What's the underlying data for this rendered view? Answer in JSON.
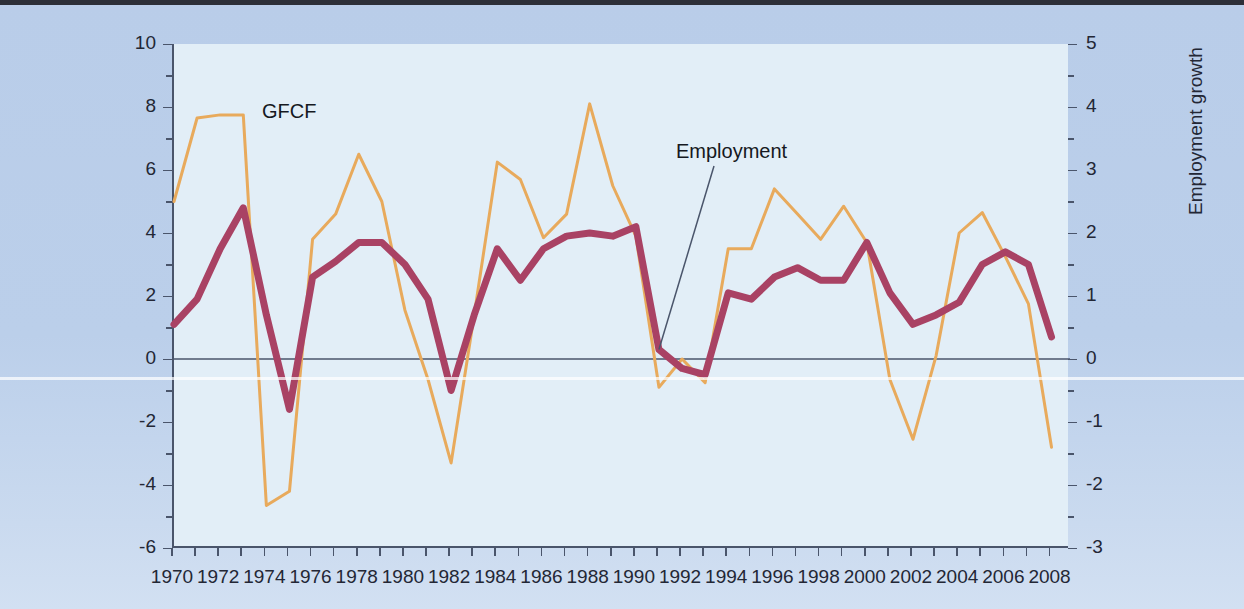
{
  "chart_data": {
    "type": "line",
    "title": "",
    "xlabel": "",
    "x": [
      1970,
      1971,
      1972,
      1973,
      1974,
      1975,
      1976,
      1977,
      1978,
      1979,
      1980,
      1981,
      1982,
      1983,
      1984,
      1985,
      1986,
      1987,
      1988,
      1989,
      1990,
      1991,
      1992,
      1993,
      1994,
      1995,
      1996,
      1997,
      1998,
      1999,
      2000,
      2001,
      2002,
      2003,
      2004,
      2005,
      2006,
      2007,
      2008
    ],
    "xtick_labels": [
      "1970",
      "1972",
      "1974",
      "1976",
      "1978",
      "1980",
      "1982",
      "1984",
      "1986",
      "1988",
      "1990",
      "1992",
      "1994",
      "1996",
      "1998",
      "2000",
      "2002",
      "2004",
      "2006",
      "2008"
    ],
    "xtick_values": [
      1970,
      1972,
      1974,
      1976,
      1978,
      1980,
      1982,
      1984,
      1986,
      1988,
      1990,
      1992,
      1994,
      1996,
      1998,
      2000,
      2002,
      2004,
      2006,
      2008
    ],
    "xlim": [
      1970,
      2008.8
    ],
    "grid": false,
    "legend_position": "inline-annotation",
    "axes": [
      {
        "id": "left",
        "label": "GFCF growth",
        "lim": [
          -6,
          10
        ],
        "ticks": [
          -6,
          -4,
          -2,
          0,
          2,
          4,
          6,
          8,
          10
        ],
        "tick_labels": [
          "-6",
          "-4",
          "-2",
          "0",
          "2",
          "4",
          "6",
          "8",
          "10"
        ],
        "minor_step": 1
      },
      {
        "id": "right",
        "label": "Employment growth",
        "lim": [
          -3,
          5
        ],
        "ticks": [
          -3,
          -2,
          -1,
          0,
          1,
          2,
          3,
          4,
          5
        ],
        "tick_labels": [
          "-3",
          "-2",
          "-1",
          "0",
          "1",
          "2",
          "3",
          "4",
          "5"
        ],
        "minor_step": 0.5
      }
    ],
    "series": [
      {
        "name": "GFCF",
        "axis": "left",
        "color": "#e8aa5c",
        "line_width": 3,
        "annotation": "GFCF",
        "values": [
          5.0,
          7.65,
          7.75,
          7.75,
          -4.65,
          -4.2,
          3.8,
          4.6,
          6.5,
          5.0,
          1.55,
          -0.65,
          -3.3,
          1.4,
          6.25,
          5.7,
          3.85,
          4.6,
          8.1,
          5.5,
          3.9,
          -0.9,
          0.0,
          -0.75,
          3.5,
          3.5,
          5.4,
          4.6,
          3.8,
          4.85,
          3.7,
          -0.65,
          -2.55,
          0.1,
          4.0,
          4.65,
          3.25,
          1.75,
          -2.8
        ]
      },
      {
        "name": "Employment",
        "axis": "right",
        "color": "#a94264",
        "line_width": 7,
        "annotation": "Employment",
        "values": [
          0.55,
          0.95,
          1.75,
          2.4,
          0.7,
          -0.8,
          1.3,
          1.55,
          1.85,
          1.85,
          1.5,
          0.95,
          -0.5,
          0.7,
          1.75,
          1.25,
          1.75,
          1.95,
          2.0,
          1.95,
          2.1,
          0.15,
          -0.15,
          -0.25,
          1.05,
          0.95,
          1.3,
          1.45,
          1.25,
          1.25,
          1.85,
          1.05,
          0.55,
          0.7,
          0.9,
          1.5,
          1.7,
          1.5,
          0.35
        ]
      }
    ],
    "annotations": [
      {
        "text": "GFCF",
        "x_fig": 262,
        "y_fig": 100
      },
      {
        "text": "Employment",
        "x_fig": 676,
        "y_fig": 140,
        "leader_to": {
          "year": 1991,
          "axis": "right",
          "value": 0.15
        }
      }
    ],
    "zero_line": true,
    "colors": {
      "figure_background": "#bbcfea",
      "plot_background": "#e2eef7",
      "axis": "#4a556b",
      "text": "#232735",
      "gfcf": "#e8aa5c",
      "employment": "#a94264"
    }
  }
}
